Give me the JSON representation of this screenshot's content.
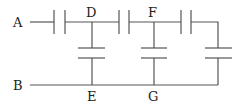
{
  "diagram": {
    "type": "capacitor-network",
    "stroke_color": "#555555",
    "nodes": {
      "A": "A",
      "B": "B",
      "D": "D",
      "E": "E",
      "F": "F",
      "G": "G"
    },
    "components": [
      {
        "id": "C1",
        "type": "capacitor",
        "between": [
          "A",
          "D"
        ],
        "orientation": "horizontal"
      },
      {
        "id": "C2",
        "type": "capacitor",
        "between": [
          "D",
          "E"
        ],
        "orientation": "vertical"
      },
      {
        "id": "C3",
        "type": "capacitor",
        "between": [
          "D",
          "F"
        ],
        "orientation": "horizontal"
      },
      {
        "id": "C4",
        "type": "capacitor",
        "between": [
          "F",
          "G"
        ],
        "orientation": "vertical"
      },
      {
        "id": "C5",
        "type": "capacitor",
        "between": [
          "F",
          "right"
        ],
        "orientation": "horizontal"
      },
      {
        "id": "C6",
        "type": "capacitor",
        "between": [
          "right",
          "G"
        ],
        "orientation": "vertical"
      }
    ]
  }
}
